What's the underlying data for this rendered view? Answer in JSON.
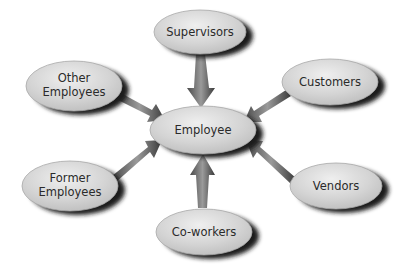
{
  "diagram": {
    "center": {
      "label": "Employee",
      "cx": 203,
      "cy": 130,
      "rx": 53,
      "ry": 24
    },
    "nodes": [
      {
        "id": "supervisors",
        "lines": [
          "Supervisors"
        ],
        "cx": 200,
        "cy": 32,
        "rx": 46,
        "ry": 22
      },
      {
        "id": "other-employees",
        "lines": [
          "Other",
          "Employees"
        ],
        "cx": 74,
        "cy": 86,
        "rx": 48,
        "ry": 25
      },
      {
        "id": "customers",
        "lines": [
          "Customers"
        ],
        "cx": 330,
        "cy": 82,
        "rx": 48,
        "ry": 23
      },
      {
        "id": "former-employees",
        "lines": [
          "Former",
          "Employees"
        ],
        "cx": 70,
        "cy": 186,
        "rx": 48,
        "ry": 25
      },
      {
        "id": "vendors",
        "lines": [
          "Vendors"
        ],
        "cx": 336,
        "cy": 186,
        "rx": 46,
        "ry": 23
      },
      {
        "id": "co-workers",
        "lines": [
          "Co-workers"
        ],
        "cx": 204,
        "cy": 232,
        "rx": 48,
        "ry": 23
      }
    ],
    "colors": {
      "ellipse_fill": "#d2d2d2",
      "ellipse_highlight": "#ececec",
      "shadow": "#1a1a1a",
      "arrow": "#6e6e6e",
      "text": "#2a2a2a"
    }
  }
}
